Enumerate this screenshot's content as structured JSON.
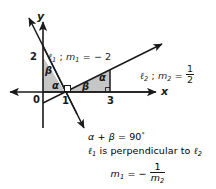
{
  "figure": {
    "type": "coordinate-geometry-diagram",
    "topic": "perpendicular lines and slopes",
    "colors": {
      "stroke": "#1a1a1a",
      "triangle_fill": "#c6c6c6",
      "background": "#ffffff"
    },
    "axes": {
      "x_label": "x",
      "y_label": "y",
      "origin_label": "0",
      "x_ticks": [
        "1",
        "3"
      ],
      "y_ticks": [
        "2"
      ]
    },
    "lines": [
      {
        "id": "l1",
        "label_script": "ℓ",
        "label_sub": "1",
        "slope_symbol": "m",
        "slope_sub": "1",
        "slope_value": "− 2",
        "full_label": "ℓ1 ; m1 = − 2",
        "through": "(0,2) and (1,0)"
      },
      {
        "id": "l2",
        "label_script": "ℓ",
        "label_sub": "2",
        "slope_symbol": "m",
        "slope_sub": "2",
        "slope_numerator": "1",
        "slope_denominator": "2",
        "full_label": "ℓ2 ; m2 = 1/2",
        "through": "(1,0) and (3,1)"
      }
    ],
    "angle_labels": {
      "alpha": "α",
      "beta": "β",
      "left_triangle": {
        "beta": "β",
        "alpha": "α"
      },
      "right_triangle": {
        "beta": "β",
        "alpha": "α"
      }
    },
    "right_angle_marker": "square at (1,0)",
    "caption": {
      "line1": {
        "alpha": "α",
        "plus": "+",
        "beta": "β",
        "equals": "=",
        "value": "90",
        "degree": "°"
      },
      "line2": {
        "l1": "ℓ",
        "l1_sub": "1",
        "text": " is perpendicular to ",
        "l2": "ℓ",
        "l2_sub": "2"
      },
      "line3": {
        "m": "m",
        "m_sub": "1",
        "equals": "=",
        "minus": "−",
        "numerator": "1",
        "den_m": "m",
        "den_sub": "2"
      }
    }
  }
}
